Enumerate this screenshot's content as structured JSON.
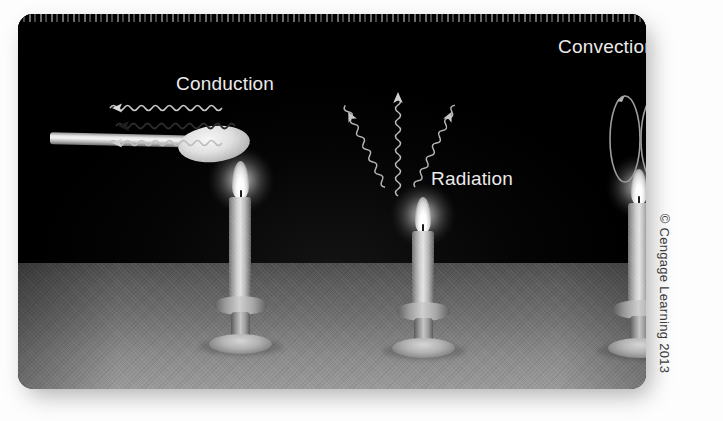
{
  "figure": {
    "kind": "science-illustration",
    "panel_background_color": "#000000",
    "table_surface_color": "#7a7a7a",
    "label_color": "#eceaea"
  },
  "labels": {
    "conduction": "Conduction",
    "radiation": "Radiation",
    "convection": "Convection"
  },
  "scenes": [
    {
      "id": "conduction",
      "label": "Conduction",
      "prop": "metal spoon held over flame",
      "arrow_count": 3,
      "arrow_style": "wavy",
      "arrow_direction": "left along spoon handle"
    },
    {
      "id": "radiation",
      "label": "Radiation",
      "prop": "bare candle flame",
      "arrow_count": 3,
      "arrow_style": "wavy",
      "arrow_direction": "outward and upward from flame"
    },
    {
      "id": "convection",
      "label": "Convection",
      "prop": "candle flame with circulating air loops",
      "arrow_count": 2,
      "arrow_style": "closed loop",
      "arrow_direction": "rising above flame and curling down"
    }
  ],
  "candles": [
    {
      "id": "candle-conduction",
      "position": "left"
    },
    {
      "id": "candle-radiation",
      "position": "center"
    },
    {
      "id": "candle-convection",
      "position": "right"
    }
  ],
  "credit": {
    "text": "© Cengage Learning 2013",
    "orientation": "rotated-90"
  }
}
